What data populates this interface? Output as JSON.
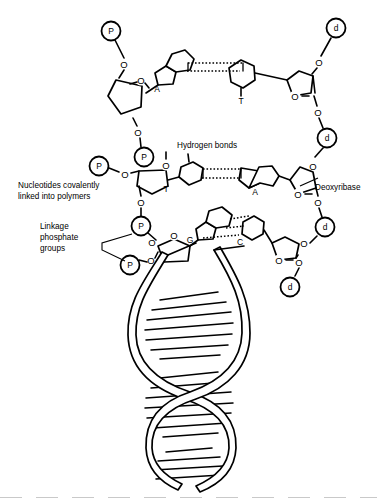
{
  "figure": {
    "background_color": "#ffffff",
    "line_color": "#000000",
    "annotations": {
      "hydrogen_bonds": "Hydrogen bonds",
      "deoxyribose": "Deoxyribase",
      "nucleotides_line1": "Nucleotides covalently",
      "nucleotides_line2": "linked into polymers",
      "linkage_line1": "Linkage",
      "linkage_line2": "phosphate",
      "linkage_line3": "groups"
    },
    "base_pairs": [
      {
        "left_base": "A",
        "right_base": "T",
        "hydrogen_bond_count": 2,
        "row": "top"
      },
      {
        "left_base": "T",
        "right_base": "A",
        "hydrogen_bond_count": 2,
        "row": "middle"
      },
      {
        "left_base": "G",
        "right_base": "C",
        "hydrogen_bond_count": 3,
        "row": "bottom"
      }
    ],
    "left_strand_groups": [
      {
        "symbol": "P",
        "name": "phosphate-group"
      },
      {
        "symbol": "P",
        "name": "phosphate-group"
      },
      {
        "symbol": "P",
        "name": "phosphate-group"
      },
      {
        "symbol": "P",
        "name": "phosphate-group"
      },
      {
        "symbol": "P",
        "name": "phosphate-group"
      }
    ],
    "right_strand_groups": [
      {
        "symbol": "d",
        "name": "deoxyribose-group"
      },
      {
        "symbol": "d",
        "name": "deoxyribose-group"
      },
      {
        "symbol": "d",
        "name": "deoxyribose-group"
      },
      {
        "symbol": "d",
        "name": "deoxyribose-group"
      }
    ],
    "oxygen_symbol": "O",
    "helix": {
      "description": "DNA double helix with two ribbon backbones and base-pair rungs",
      "turns": 3
    }
  }
}
